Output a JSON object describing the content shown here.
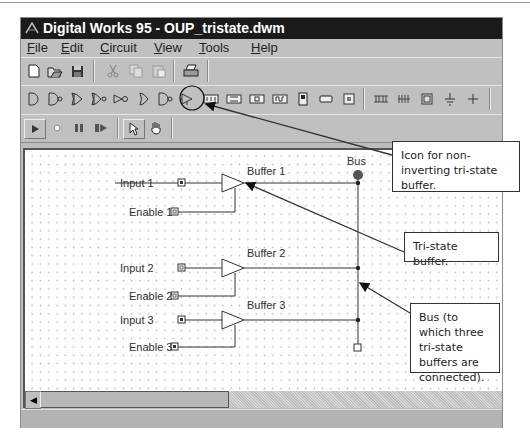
{
  "window": {
    "title": "Digital Works 95 - OUP_tristate.dwm",
    "app_icon": "digital-works-logo-icon"
  },
  "menu": {
    "items": [
      {
        "label": "File"
      },
      {
        "label": "Edit"
      },
      {
        "label": "Circuit"
      },
      {
        "label": "View"
      },
      {
        "label": "Tools"
      },
      {
        "label": "Help"
      }
    ]
  },
  "toolbar_file": {
    "buttons": [
      {
        "icon": "new-file-icon"
      },
      {
        "icon": "open-folder-icon"
      },
      {
        "icon": "save-disk-icon"
      },
      {
        "icon": "cut-scissors-icon"
      },
      {
        "icon": "copy-icon"
      },
      {
        "icon": "paste-icon"
      },
      {
        "icon": "print-icon"
      }
    ]
  },
  "toolbar_components": {
    "buttons": [
      {
        "icon": "and-gate-icon"
      },
      {
        "icon": "nand-gate-icon"
      },
      {
        "icon": "or-gate-icon"
      },
      {
        "icon": "nor-gate-icon"
      },
      {
        "icon": "inverter-icon"
      },
      {
        "icon": "xor-gate-icon"
      },
      {
        "icon": "xnor-gate-icon"
      },
      {
        "icon": "tristate-buffer-icon"
      },
      {
        "icon": "flip-flop-jk-icon"
      },
      {
        "icon": "flip-flop-d-icon"
      },
      {
        "icon": "counter-icon"
      },
      {
        "icon": "clock-icon"
      },
      {
        "icon": "switch-icon"
      },
      {
        "icon": "led-icon"
      },
      {
        "icon": "input-terminal-icon"
      },
      {
        "icon": "seven-segment-icon"
      },
      {
        "icon": "memory-icon"
      },
      {
        "icon": "output-terminal-icon"
      },
      {
        "icon": "ground-icon"
      },
      {
        "icon": "wire-junction-icon"
      }
    ]
  },
  "toolbar_sim": {
    "buttons": [
      {
        "icon": "run-play-icon"
      },
      {
        "icon": "stop-icon"
      },
      {
        "icon": "pause-icon"
      },
      {
        "icon": "step-icon"
      },
      {
        "icon": "select-pointer-icon"
      },
      {
        "icon": "hand-interact-icon"
      }
    ]
  },
  "circuit": {
    "bus_label": "Bus",
    "buffers": [
      {
        "label": "Buffer 1",
        "input_label": "Input 1",
        "enable_label": "Enable 1",
        "input_state": "high",
        "enable_state": "low"
      },
      {
        "label": "Buffer 2",
        "input_label": "Input 2",
        "enable_label": "Enable 2",
        "input_state": "low",
        "enable_state": "low"
      },
      {
        "label": "Buffer 3",
        "input_label": "Input 3",
        "enable_label": "Enable 3",
        "input_state": "high",
        "enable_state": "high"
      }
    ]
  },
  "annotations": [
    {
      "text": "Icon for non-inverting tri-state buffer."
    },
    {
      "text": "Tri-state buffer."
    },
    {
      "text": "Bus (to which three tri-state buffers are connected)."
    }
  ]
}
